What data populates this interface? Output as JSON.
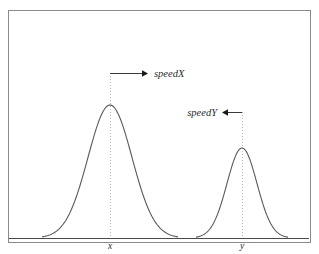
{
  "figure": {
    "type": "plot",
    "background_color": "#ffffff",
    "frame": {
      "name": "plot-frame",
      "x": 8,
      "y": 10,
      "width": 302,
      "height": 232,
      "stroke_color": "#8a8a8a",
      "stroke_width": 1
    },
    "baseline": {
      "name": "baseline-axis",
      "y": 238,
      "x_start": 9,
      "x_end": 309,
      "stroke_color": "#4a4a4a"
    }
  },
  "chart_data": {
    "type": "line",
    "title": "",
    "xlabel": "",
    "ylabel": "",
    "grid": false,
    "legend": null,
    "curve_color": "#5a5a5a",
    "curve_stroke_width": 1.1,
    "baseline_y": 238,
    "series": [
      {
        "name": "distribution-x",
        "shape": "gaussian",
        "peak_x": 110,
        "peak_y": 105,
        "amplitude": 133,
        "sigma": 22,
        "tail_left_x": 42,
        "tail_right_x": 178,
        "tick_label": "x"
      },
      {
        "name": "distribution-y",
        "shape": "gaussian",
        "peak_x": 242,
        "peak_y": 148,
        "amplitude": 90,
        "sigma": 15,
        "tail_left_x": 196,
        "tail_right_x": 288,
        "tick_label": "y"
      }
    ],
    "annotations": [
      {
        "name": "speedX-annotation",
        "label": "speedX",
        "direction": "right",
        "line_y": 73,
        "line_x_start": 110,
        "line_x_end": 148,
        "label_x": 154,
        "label_y": 77,
        "anchor_peak": "distribution-x",
        "color": "#3a3a3a"
      },
      {
        "name": "speedY-annotation",
        "label": "speedY",
        "direction": "left",
        "line_y": 112,
        "line_x_start": 242,
        "line_x_end": 222,
        "label_x": 217,
        "label_y": 116,
        "anchor_peak": "distribution-y",
        "color": "#3a3a3a"
      }
    ],
    "dotted_guides": [
      {
        "name": "guide-line-x",
        "x": 110,
        "y_top": 73,
        "y_bottom": 238,
        "color": "#b8b8b8"
      },
      {
        "name": "guide-line-y",
        "x": 242,
        "y_top": 112,
        "y_bottom": 238,
        "color": "#b8b8b8"
      }
    ],
    "tick_labels": [
      {
        "name": "tick-label-x",
        "text": "x",
        "x": 110,
        "y": 249
      },
      {
        "name": "tick-label-y",
        "text": "y",
        "x": 242,
        "y": 249
      }
    ]
  }
}
